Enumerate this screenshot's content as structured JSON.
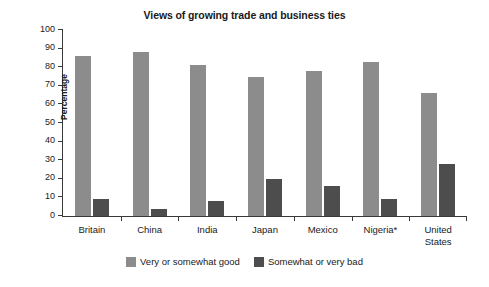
{
  "chart_data": {
    "type": "bar",
    "title": "Views of growing trade and business ties",
    "xlabel": "",
    "ylabel": "Percentage",
    "ylim": [
      0,
      100
    ],
    "ytick_labels": [
      "100",
      "90",
      "80",
      "70",
      "60",
      "50",
      "40",
      "30",
      "20",
      "10",
      "0"
    ],
    "yticks": [
      100,
      90,
      80,
      70,
      60,
      50,
      40,
      30,
      20,
      10,
      0
    ],
    "grid": false,
    "legend_position": "bottom-center",
    "categories": [
      "Britain",
      "China",
      "India",
      "Japan",
      "Mexico",
      "Nigeria*",
      "United States"
    ],
    "category_labels_display": [
      "Britain",
      "China",
      "India",
      "Japan",
      "Mexico",
      "Nigeria*",
      "United\nStates"
    ],
    "series": [
      {
        "name": "Very or somewhat good",
        "color": "#8c8c8c",
        "values": [
          86,
          88,
          81,
          75,
          78,
          83,
          66
        ]
      },
      {
        "name": "Somewhat or very bad",
        "color": "#4d4d4d",
        "values": [
          9,
          4,
          8,
          20,
          16,
          9,
          28
        ]
      }
    ]
  },
  "legend": {
    "items": [
      {
        "label": "Very or somewhat good",
        "swatch": "light-gray-swatch"
      },
      {
        "label": "Somewhat or very bad",
        "swatch": "dark-gray-swatch"
      }
    ]
  },
  "colors": {
    "series_good": "#8c8c8c",
    "series_bad": "#4d4d4d",
    "axis": "#3a3a3a",
    "text": "#1a1a1a",
    "background": "#ffffff"
  }
}
